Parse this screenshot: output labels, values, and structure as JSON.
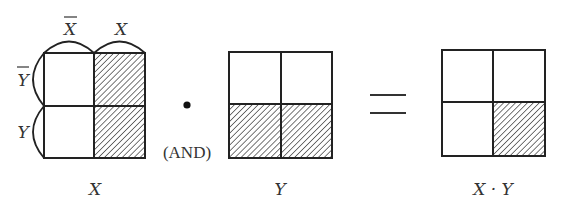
{
  "diagram": {
    "type": "venn-grid-logic",
    "operator_symbol": "•",
    "operator_label": "(AND)",
    "equals_symbol": "=",
    "line_color": "#222222",
    "hatch_color": "#555555",
    "grids": [
      {
        "id": "X",
        "caption": "X",
        "column_labels": [
          "X",
          "X"
        ],
        "column_label_overbar": [
          true,
          false
        ],
        "row_labels": [
          "Y",
          "Y"
        ],
        "row_label_overbar": [
          true,
          false
        ],
        "shaded_cells": [
          [
            false,
            true
          ],
          [
            false,
            true
          ]
        ]
      },
      {
        "id": "Y",
        "caption": "Y",
        "shaded_cells": [
          [
            false,
            false
          ],
          [
            true,
            true
          ]
        ]
      },
      {
        "id": "XY",
        "caption": "X · Y",
        "shaded_cells": [
          [
            false,
            false
          ],
          [
            false,
            true
          ]
        ]
      }
    ]
  }
}
